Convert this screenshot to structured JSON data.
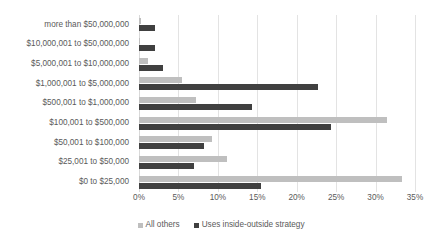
{
  "chart_data": {
    "type": "bar",
    "orientation": "horizontal",
    "title": "",
    "subtitle": "",
    "xlabel": "",
    "ylabel": "",
    "xlim": [
      0,
      35
    ],
    "xtick_labels": [
      "0%",
      "5%",
      "10%",
      "15%",
      "20%",
      "25%",
      "30%",
      "35%"
    ],
    "xtick_values": [
      0,
      5,
      10,
      15,
      20,
      25,
      30,
      35
    ],
    "grid": true,
    "legend_position": "bottom",
    "categories": [
      "more than $50,000,000",
      "$10,000,001 to $50,000,000",
      "$5,000,001 to $10,000,000",
      "$1,000,001 to $5,000,000",
      "$500,001 to $1,000,000",
      "$100,001 to $500,000",
      "$50,001 to $100,000",
      "$25,001 to $50,000",
      "$0 to $25,000"
    ],
    "series": [
      {
        "name": "All others",
        "color": "#bfbfbf",
        "values": [
          0.3,
          0.1,
          1.2,
          5.5,
          7.2,
          31.4,
          9.3,
          11.1,
          33.3
        ]
      },
      {
        "name": "Uses inside-outside strategy",
        "color": "#404040",
        "values": [
          2.0,
          2.0,
          3.0,
          22.7,
          14.3,
          24.4,
          8.2,
          7.0,
          15.5
        ]
      }
    ]
  },
  "colors": {
    "series_all_others": "#bfbfbf",
    "series_inside_outside": "#404040",
    "gridline": "#e3e3e3",
    "text": "#5a5a5a",
    "background": "#ffffff"
  }
}
